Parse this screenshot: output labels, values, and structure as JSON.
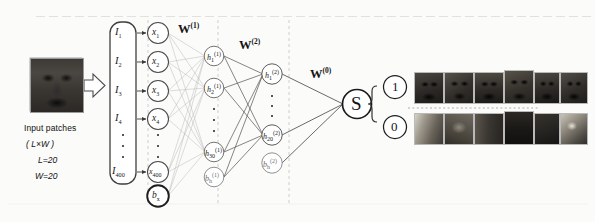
{
  "figure": {
    "background": "#fbfbfa"
  },
  "input_block": {
    "thumbnail_name": "input-face-patch-thumbnail",
    "caption_line1": "Input patches",
    "caption_line2": "( L×W )",
    "caption_line3": "L=20",
    "caption_line4": "W=20",
    "arrow_name": "block-arrow-right"
  },
  "input_vector": {
    "label": "input-vector-I",
    "entries": [
      "I",
      "I",
      "I",
      "I",
      "I"
    ],
    "subscripts": [
      "1",
      "2",
      "3",
      "4",
      "400"
    ],
    "ellipsis": "⋮"
  },
  "input_layer": {
    "name": "input-neuron-layer-x",
    "nodes": [
      {
        "base": "x",
        "sub": "1",
        "sup": ""
      },
      {
        "base": "x",
        "sub": "2",
        "sup": ""
      },
      {
        "base": "x",
        "sub": "3",
        "sup": ""
      },
      {
        "base": "x",
        "sub": "4",
        "sup": ""
      },
      {
        "base": "x",
        "sub": "400",
        "sup": ""
      }
    ],
    "bias": {
      "base": "b",
      "sub": "x",
      "sup": ""
    }
  },
  "hidden_layer_1": {
    "name": "hidden-layer-1",
    "nodes": [
      {
        "base": "h",
        "sub": "1",
        "sup": "(1)"
      },
      {
        "base": "h",
        "sub": "2",
        "sup": "(1)"
      },
      {
        "base": "h",
        "sub": "30",
        "sup": "(1)"
      }
    ],
    "bias": {
      "base": "b",
      "sub": "h",
      "sup": "(1)"
    }
  },
  "hidden_layer_2": {
    "name": "hidden-layer-2",
    "nodes": [
      {
        "base": "h",
        "sub": "1",
        "sup": "(2)"
      },
      {
        "base": "h",
        "sub": "20",
        "sup": "(2)"
      }
    ],
    "bias": {
      "base": "b",
      "sub": "h",
      "sup": "(2)"
    }
  },
  "weights": [
    {
      "symbol": "W",
      "sup": "(1)",
      "name": "weight-label-w1"
    },
    {
      "symbol": "W",
      "sup": "(2)",
      "name": "weight-label-w2"
    },
    {
      "symbol": "W",
      "sup": "(0)",
      "name": "weight-label-w0"
    }
  ],
  "softmax": {
    "label": "S",
    "name": "softmax-output-node"
  },
  "outputs": [
    {
      "label": "1",
      "name": "output-class-1",
      "patch_count": 6
    },
    {
      "label": "0",
      "name": "output-class-0",
      "patch_count": 6
    }
  ],
  "colors": {
    "ink": "#1c1c1c",
    "edge": "#7d7d7d",
    "faint_edge": "#c9c9c9",
    "dashed_guide": "#c4c4c4",
    "node_stroke": "#4a4a4a",
    "bg": "#fbfbfa"
  }
}
